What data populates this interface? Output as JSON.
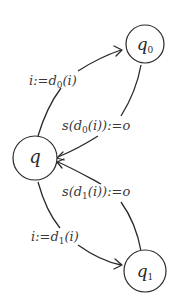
{
  "diagram": {
    "type": "state-machine",
    "states": [
      {
        "id": "q",
        "label": "q",
        "subscript": ""
      },
      {
        "id": "q0",
        "label": "q",
        "subscript": "0"
      },
      {
        "id": "q1",
        "label": "q",
        "subscript": "1"
      }
    ],
    "edges": [
      {
        "from": "q",
        "to": "q0",
        "label": {
          "pre": "i:=d",
          "sub": "0",
          "post": "(i)"
        }
      },
      {
        "from": "q0",
        "to": "q",
        "label": {
          "pre": "s(d",
          "sub": "0",
          "post": "(i)):=o"
        }
      },
      {
        "from": "q1",
        "to": "q",
        "label": {
          "pre": "s(d",
          "sub": "1",
          "post": "(i)):=o"
        }
      },
      {
        "from": "q",
        "to": "q1",
        "label": {
          "pre": "i:=d",
          "sub": "1",
          "post": "(i)"
        }
      }
    ],
    "colors": {
      "stroke": "#2a2a2a",
      "background": "#ffffff"
    }
  }
}
